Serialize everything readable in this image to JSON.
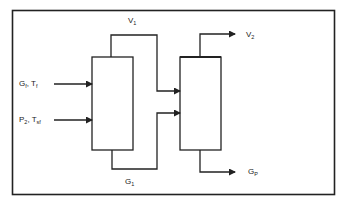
{
  "diagram": {
    "type": "process-flow",
    "colors": {
      "line": "#222222",
      "background": "#ffffff",
      "text": "#222222"
    },
    "units": [
      {
        "id": "unit-1",
        "label": ""
      },
      {
        "id": "unit-2",
        "label": ""
      }
    ],
    "streams": {
      "feed_gas": {
        "main": "G",
        "sub": "f",
        "sep": ", ",
        "main2": "T",
        "sub2": "f"
      },
      "feed_p2": {
        "main": "P",
        "sub": "2",
        "sep": ", ",
        "main2": "T",
        "sub2": "sf"
      },
      "vapor_1": {
        "main": "V",
        "sub": "1"
      },
      "vapor_2": {
        "main": "V",
        "sub": "2"
      },
      "gas_1": {
        "main": "G",
        "sub": "1"
      },
      "gas_product": {
        "main": "G",
        "sub": "P"
      }
    },
    "connections": [
      {
        "from": "G_f, T_f",
        "to": "unit-1"
      },
      {
        "from": "P_2, T_sf",
        "to": "unit-1"
      },
      {
        "from": "unit-1 top",
        "to": "unit-2",
        "stream": "V_1"
      },
      {
        "from": "unit-1 bottom",
        "to": "unit-2",
        "stream": "G_1"
      },
      {
        "from": "unit-2 top",
        "to": "out",
        "stream": "V_2"
      },
      {
        "from": "unit-2 bottom",
        "to": "out",
        "stream": "G_P"
      }
    ]
  }
}
